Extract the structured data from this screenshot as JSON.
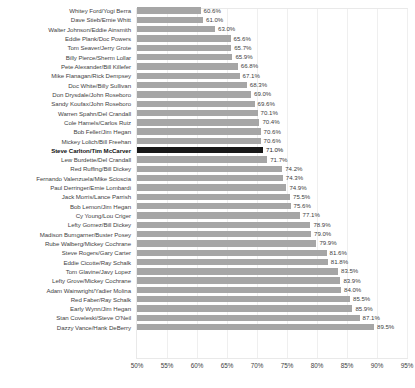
{
  "chart_data": {
    "type": "bar",
    "orientation": "horizontal",
    "title": "",
    "subtitle": "",
    "xlabel": "",
    "ylabel": "",
    "xlim": [
      50,
      95
    ],
    "xtick_labels": [
      "50%",
      "55%",
      "60%",
      "65%",
      "70%",
      "75%",
      "80%",
      "85%",
      "90%",
      "95%"
    ],
    "xtick_values": [
      50,
      55,
      60,
      65,
      70,
      75,
      80,
      85,
      90,
      95
    ],
    "grid": "vertical",
    "legend": "none",
    "value_label_suffix": "%",
    "bar_color": "#a6a6a6",
    "highlight_color": "#181818",
    "highlight_category": "Steve Carlton/Tim McCarver",
    "categories": [
      "Whitey Ford/Yogi Berra",
      "Dave Stieb/Ernie Whitt",
      "Walter Johnson/Eddie Ainsmith",
      "Eddie Plank/Doc Powers",
      "Tom Seaver/Jerry Grote",
      "Billy Pierce/Sherm Lollar",
      "Pete Alexander/Bill Killefer",
      "Mike Flanagan/Rick Dempsey",
      "Doc White/Billy Sullivan",
      "Don Drysdale/John Roseboro",
      "Sandy Koufax/John Roseboro",
      "Warren Spahn/Del Crandall",
      "Cole Hamels/Carlos Ruiz",
      "Bob Feller/Jim Hegan",
      "Mickey Lolich/Bill Freehan",
      "Steve Carlton/Tim McCarver",
      "Lew Burdette/Del Crandall",
      "Red Ruffing/Bill Dickey",
      "Fernando Valenzuela/Mike Scioscia",
      "Paul Derringer/Ernie Lombardi",
      "Jack Morris/Lance Parrish",
      "Bob Lemon/Jim Hegan",
      "Cy Young/Lou Criger",
      "Lefty Gomez/Bill Dickey",
      "Madison Bumgarner/Buster Posey",
      "Rube Walberg/Mickey Cochrane",
      "Steve Rogers/Gary Carter",
      "Eddie Cicotte/Ray Schalk",
      "Tom Glavine/Javy Lopez",
      "Lefty Grove/Mickey Cochrane",
      "Adam Wainwright/Yadier Molina",
      "Red Faber/Ray Schalk",
      "Early Wynn/Jim Hegan",
      "Stan Coveleski/Steve O'Neil",
      "Dazzy Vance/Hank DeBerry"
    ],
    "values": [
      60.6,
      61.0,
      63.0,
      65.6,
      65.7,
      65.9,
      66.8,
      67.1,
      68.3,
      69.0,
      69.6,
      70.1,
      70.4,
      70.6,
      70.6,
      71.0,
      71.7,
      74.2,
      74.3,
      74.9,
      75.5,
      75.6,
      77.1,
      78.9,
      79.0,
      79.9,
      81.6,
      81.8,
      83.5,
      83.9,
      84.0,
      85.5,
      85.9,
      87.1,
      89.5
    ],
    "value_labels": [
      "60.6%",
      "61.0%",
      "63.0%",
      "65.6%",
      "65.7%",
      "65.9%",
      "66.8%",
      "67.1%",
      "68.3%",
      "69.0%",
      "69.6%",
      "70.1%",
      "70.4%",
      "70.6%",
      "70.6%",
      "71.0%",
      "71.7%",
      "74.2%",
      "74.3%",
      "74.9%",
      "75.5%",
      "75.6%",
      "77.1%",
      "78.9%",
      "79.0%",
      "79.9%",
      "81.6%",
      "81.8%",
      "83.5%",
      "83.9%",
      "84.0%",
      "85.5%",
      "85.9%",
      "87.1%",
      "89.5%"
    ]
  }
}
